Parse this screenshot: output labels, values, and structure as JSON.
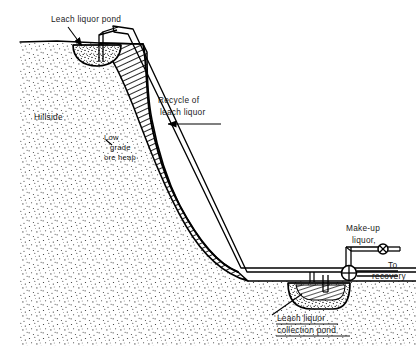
{
  "figure": {
    "type": "engineering-cross-section-diagram",
    "background_color": "#ffffff",
    "line_color": "#000000",
    "hatch_color": "#1a1a1a",
    "stipple_color": "#2b2b2b"
  },
  "labels": {
    "leach_liquor_pond": "Leach liquor pond",
    "hillside": "Hillside",
    "low_grade_ore_heap_line1": "Low",
    "low_grade_ore_heap_line2": "grade",
    "low_grade_ore_heap_line3": "ore heap",
    "recycle_line1": "Recycle of",
    "recycle_line2": "leach liquor",
    "makeup_line1": "Make-up",
    "makeup_line2": "liquor,",
    "to_recovery_line1": "To",
    "to_recovery_line2": "recovery",
    "collection_pond_line1": "Leach liquor",
    "collection_pond_line2": "collection pond"
  },
  "components": {
    "leach_liquor_pond": "pond at hill crest that feeds the ore heap",
    "low_grade_ore_heap": "hatched wedge of low grade ore banked on the hillside",
    "hillside": "stippled natural ground profile",
    "recycle_pipe": "double-line pipe carrying recycled leach liquor down the slope",
    "collection_pond": "stippled basin at the toe of the slope",
    "pump": "circular pump symbol at the pipe junction",
    "makeup_valve": "valve symbol on the make-up liquor feed line",
    "to_recovery_line": "outlet pipe to metal recovery"
  }
}
